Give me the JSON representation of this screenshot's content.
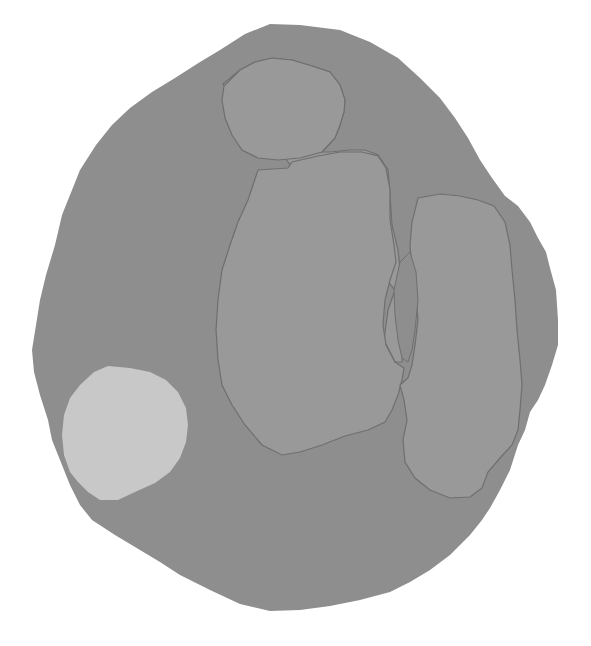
{
  "image": {
    "width": 591,
    "height": 646,
    "background": "#ffffff",
    "description": "Grayscale segmentation-style figure: large irregular outer blob containing a head-like region, a torso-like region, a tall elongated region on the right, and a light circular region at lower left."
  },
  "colors": {
    "outer_blob": "#8e8e8e",
    "inner_region": "#999999",
    "inner_outline": "#6f6f6f",
    "light_circle": "#c8c8c8"
  },
  "regions": [
    {
      "name": "outer-blob",
      "label": "Outer region"
    },
    {
      "name": "head-region",
      "label": "Upper rounded region"
    },
    {
      "name": "torso-region",
      "label": "Central large region"
    },
    {
      "name": "right-region",
      "label": "Right elongated region"
    },
    {
      "name": "light-circle",
      "label": "Light circular region"
    }
  ]
}
